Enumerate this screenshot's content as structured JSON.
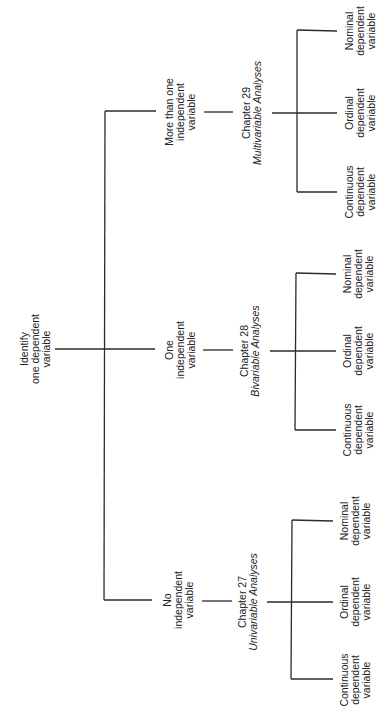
{
  "diagram": {
    "root": {
      "lines": [
        "Identify",
        "one dependent",
        "variable"
      ]
    },
    "branches": [
      {
        "condition": [
          "More than one",
          "independent",
          "variable"
        ],
        "chapter": "Chapter 29",
        "analysis": "Multivariable Analyses",
        "outcomes": [
          [
            "Nominal",
            "dependent",
            "variable"
          ],
          [
            "Ordinal",
            "dependent",
            "variable"
          ],
          [
            "Continuous",
            "dependent",
            "variable"
          ]
        ]
      },
      {
        "condition": [
          "One",
          "independent",
          "variable"
        ],
        "chapter": "Chapter 28",
        "analysis": "Bivariable Analyses",
        "outcomes": [
          [
            "Nominal",
            "dependent",
            "variable"
          ],
          [
            "Ordinal",
            "dependent",
            "variable"
          ],
          [
            "Continuous",
            "dependent",
            "variable"
          ]
        ]
      },
      {
        "condition": [
          "No",
          "independent",
          "variable"
        ],
        "chapter": "Chapter 27",
        "analysis": "Univariable Analyses",
        "outcomes": [
          [
            "Nominal",
            "dependent",
            "variable"
          ],
          [
            "Ordinal",
            "dependent",
            "variable"
          ],
          [
            "Continuous",
            "dependent",
            "variable"
          ]
        ]
      }
    ],
    "line_color": "#2a2a2a"
  }
}
